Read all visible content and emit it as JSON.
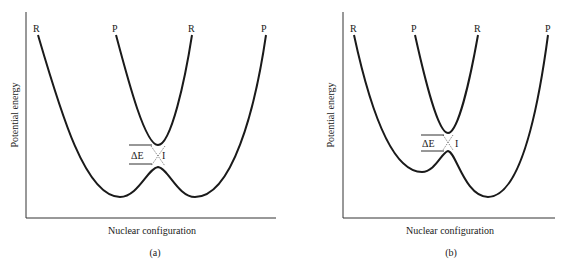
{
  "panels": [
    {
      "id": "a",
      "caption": "(a)",
      "xlabel": "Nuclear configuration",
      "ylabel": "Potential energy",
      "curve_labels": [
        "R",
        "P",
        "R",
        "P"
      ],
      "gap_label": "ΔE",
      "intersection_label": "I"
    },
    {
      "id": "b",
      "caption": "(b)",
      "xlabel": "Nuclear configuration",
      "ylabel": "Potential energy",
      "curve_labels": [
        "R",
        "P",
        "R",
        "P"
      ],
      "gap_label": "ΔE",
      "intersection_label": "I"
    }
  ],
  "colors": {
    "line": "#1a1a1a",
    "background": "#ffffff"
  }
}
